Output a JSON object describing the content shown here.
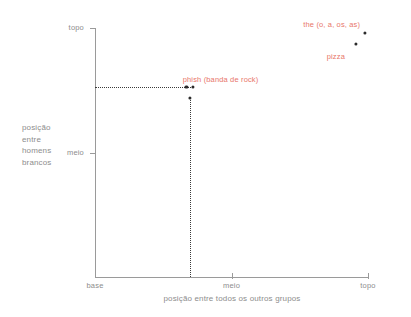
{
  "chart_data": {
    "type": "scatter",
    "title": "",
    "xlabel": "posição entre todos os outros grupos",
    "ylabel": "posição entre homens brancos",
    "ylabel_lines": [
      "posição",
      "entre",
      "homens",
      "brancos"
    ],
    "xlim": [
      0,
      1
    ],
    "ylim": [
      0,
      1
    ],
    "grid": false,
    "legend": "none",
    "xticks": [
      {
        "value": 0,
        "label": "base"
      },
      {
        "value": 0.5,
        "label": "meio"
      },
      {
        "value": 1,
        "label": "topo"
      }
    ],
    "yticks": [
      {
        "value": 0.5,
        "label": "meio"
      },
      {
        "value": 1,
        "label": "topo"
      }
    ],
    "points": [
      {
        "label": "the (o, a, os, as)",
        "x": 0.99,
        "y": 0.98,
        "label_dx": -62,
        "label_dy": -13
      },
      {
        "label": "pizza",
        "x": 0.955,
        "y": 0.935,
        "label_dx": -29,
        "label_dy": 8
      },
      {
        "label": "phish (banda de rock)",
        "x": 0.358,
        "y": 0.762,
        "label_dx": -10,
        "label_dy": -12
      },
      {
        "label": "",
        "x": 0.335,
        "y": 0.762,
        "label_dx": 0,
        "label_dy": 0
      },
      {
        "label": "",
        "x": 0.348,
        "y": 0.72,
        "label_dx": 0,
        "label_dy": 0
      }
    ],
    "guides": {
      "horizontal_from_axis_to_x": 0.358,
      "horizontal_y": 0.762,
      "vertical_x": 0.348,
      "vertical_from_y": 0.72,
      "vertical_to_y": 0.0
    },
    "colors": {
      "label": "#e8766a",
      "point": "#2b2b2b",
      "axis": "#9a9a9a",
      "text": "#8d8d8d",
      "guide": "#3a3a3a",
      "background": "#ffffff"
    }
  }
}
